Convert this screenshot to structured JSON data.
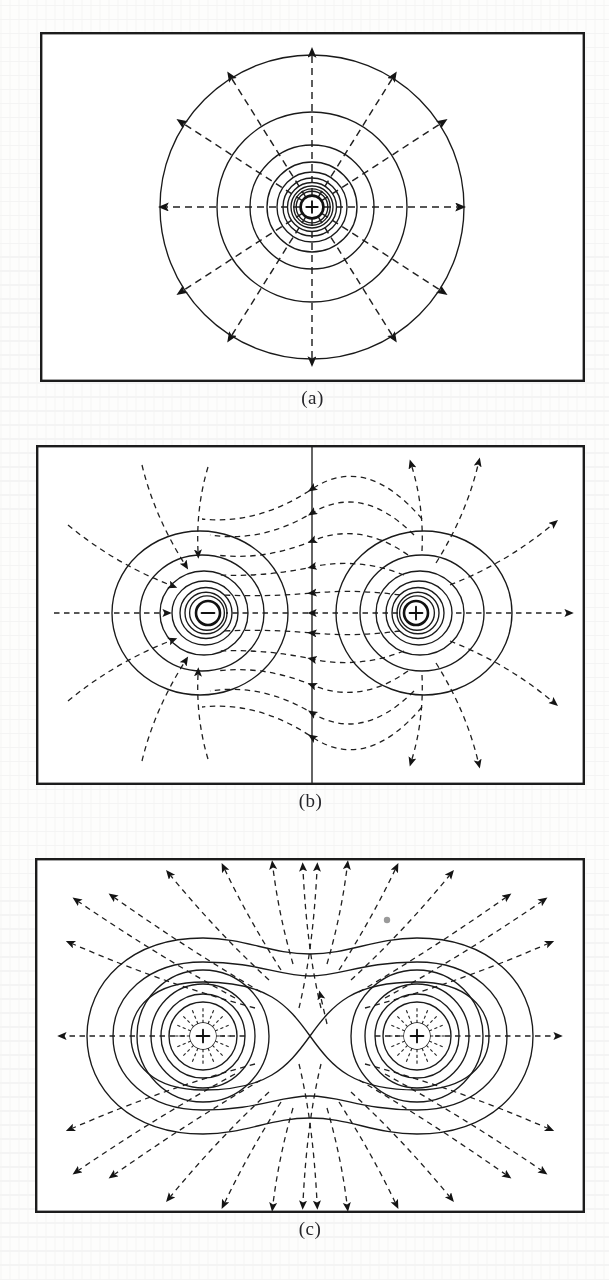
{
  "figure": {
    "kind": "physics-diagram",
    "panel_count": 3,
    "legend_meaning": {
      "solid_curves": "equipotential surfaces",
      "dashed_curves_with_arrows": "electric field lines",
      "arrow_direction": "direction of the electric field E"
    }
  },
  "panels": [
    {
      "id": "a",
      "caption": "(a)",
      "configuration": "single positive point charge",
      "charges": [
        {
          "sign": "+",
          "glyph": "+",
          "x": 0.0,
          "y": 0.0,
          "magnitude": 1
        }
      ],
      "equipotential_count": 10,
      "field_line_count": 12,
      "field_line_kind": "radial straight lines directed outward",
      "equipotential_kind": "concentric circles, spacing grows with radius"
    },
    {
      "id": "b",
      "caption": "(b)",
      "configuration": "electric dipole: equal and opposite charges",
      "charges": [
        {
          "sign": "-",
          "glyph": "−",
          "x": -1.0,
          "y": 0.0,
          "magnitude": -1
        },
        {
          "sign": "+",
          "glyph": "+",
          "x": 1.0,
          "y": 0.0,
          "magnitude": 1
        }
      ],
      "equipotential_count": 14,
      "field_line_count": 18,
      "field_line_kind": "curves running from the positive charge to the negative charge",
      "equipotential_kind": "distorted circles about each charge plus a straight vertical zero-potential plane at the midline",
      "has_zero_potential_plane": true
    },
    {
      "id": "c",
      "caption": "(c)",
      "configuration": "two equal positive charges",
      "charges": [
        {
          "sign": "+",
          "glyph": "+",
          "x": -1.0,
          "y": 0.0,
          "magnitude": 1
        },
        {
          "sign": "+",
          "glyph": "+",
          "x": 1.0,
          "y": 0.0,
          "magnitude": 1
        }
      ],
      "equipotential_count": 12,
      "field_line_count": 36,
      "field_line_kind": "curves directed outward from both charges, repelled away from the midline",
      "equipotential_kind": "circles near each charge merging into peanut / figure-eight shaped outer curves",
      "has_saddle_point": true,
      "saddle_point_note": "self-crossing equipotential at the midpoint where E = 0"
    }
  ],
  "colors": {
    "ink": "#1a1a1a",
    "frame": "#1c1c1c",
    "paper": "#fdfdfc",
    "speck": "#9a9a9a"
  }
}
